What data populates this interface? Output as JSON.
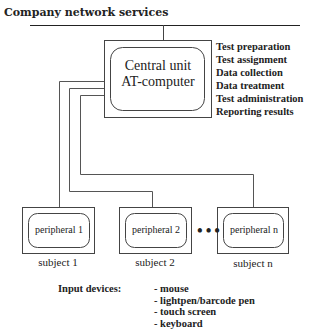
{
  "network": {
    "title": "Company network services"
  },
  "central_unit": {
    "line1": "Central unit",
    "line2": "AT-computer"
  },
  "tasks": [
    "Test preparation",
    "Test assignment",
    "Data collection",
    "Data treatment",
    "Test administration",
    "Reporting results"
  ],
  "peripherals": [
    {
      "label": "peripheral 1",
      "subject": "subject 1"
    },
    {
      "label": "peripheral 2",
      "subject": "subject 2"
    },
    {
      "label": "peripheral n",
      "subject": "subject n"
    }
  ],
  "ellipsis": "•••",
  "input_devices": {
    "label": "Input devices:",
    "items": [
      "- mouse",
      "- lightpen/barcode pen",
      "- touch screen",
      "- keyboard"
    ]
  }
}
